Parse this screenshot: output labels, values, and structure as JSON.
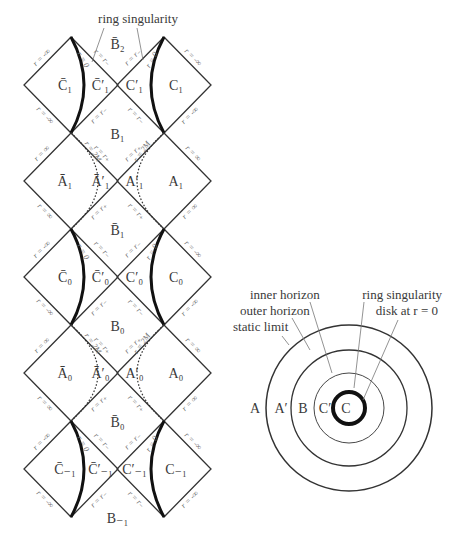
{
  "figure": {
    "penrose": {
      "callout": "ring singularity",
      "rows": [
        {
          "type": "C",
          "left_region": "C̄₁",
          "left_inner": "C̄′₁",
          "right_inner": "C′₁",
          "right_region": "C₁",
          "top_label": "B̄₂",
          "bottom_label": "B₁",
          "outer_edge": "r = -∞",
          "sing_label": "r = 0",
          "horizon": "r = r₋"
        },
        {
          "type": "A",
          "left_region": "Ā₁",
          "left_inner": "Ā′₁",
          "right_inner": "A′₁",
          "right_region": "A₁",
          "bottom_label": "B̄₁",
          "outer_edge": "r = ∞",
          "limit_label": "r = 2M",
          "horizon": "r = r₊"
        },
        {
          "type": "C",
          "left_region": "C̄₀",
          "left_inner": "C̄′₀",
          "right_inner": "C′₀",
          "right_region": "C₀",
          "bottom_label": "B₀",
          "outer_edge": "r = -∞",
          "sing_label": "r = 0",
          "horizon": "r = r₋"
        },
        {
          "type": "A",
          "left_region": "Ā₀",
          "left_inner": "Ā′₀",
          "right_inner": "A′₀",
          "right_region": "A₀",
          "bottom_label": "B̄₀",
          "outer_edge": "r = ∞",
          "limit_label": "r = 2M",
          "horizon": "r = r₊"
        },
        {
          "type": "C",
          "left_region": "C̄₋₁",
          "left_inner": "C̄′₋₁",
          "right_inner": "C′₋₁",
          "right_region": "C₋₁",
          "bottom_label": "B₋₁",
          "outer_edge": "r = -∞",
          "sing_label": "r = 0",
          "horizon": "r = r₋"
        }
      ]
    },
    "cross_section": {
      "labels": {
        "inner_horizon": "inner horizon",
        "outer_horizon": "outer horizon",
        "static_limit": "static limit",
        "ring_singularity": "ring singularity",
        "disk": "disk at r = 0"
      },
      "regions": [
        "A",
        "A′",
        "B",
        "C′",
        "C"
      ],
      "radii": [
        83,
        58,
        35,
        16
      ]
    },
    "colors": {
      "line": "#333333",
      "singularity": "#111111",
      "label": "#6e6e6e"
    }
  }
}
